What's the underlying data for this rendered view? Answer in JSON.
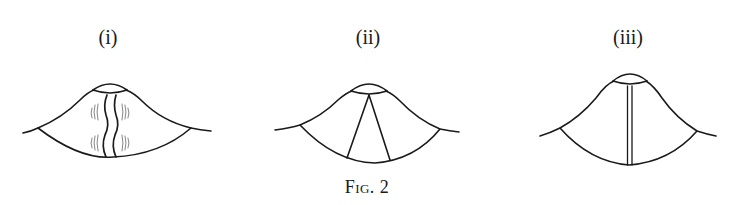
{
  "figure": {
    "caption_prefix": "Fig.",
    "caption_number": "2",
    "stroke_color": "#1a1a1a",
    "background": "#ffffff",
    "panels": [
      {
        "label": "(i)",
        "feature": "wavy double fissure with hatching",
        "x_center": 108
      },
      {
        "label": "(ii)",
        "feature": "two diverging straight lines from apex",
        "x_center": 368
      },
      {
        "label": "(iii)",
        "feature": "single straight double vertical line",
        "x_center": 628
      }
    ]
  }
}
